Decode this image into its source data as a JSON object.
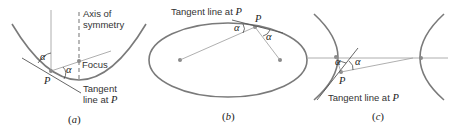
{
  "figure": {
    "panels": [
      {
        "id": "a",
        "shape": "parabola",
        "caption": "(a)",
        "caption_letter": "a",
        "labels": {
          "axis_line1": "Axis of",
          "axis_line2": "symmetry",
          "focus": "Focus",
          "tangent_line1": "Tangent",
          "tangent_line2": "line at",
          "point": "P",
          "angle": "α"
        }
      },
      {
        "id": "b",
        "shape": "ellipse",
        "caption": "(b)",
        "caption_letter": "b",
        "labels": {
          "tangent": "Tangent line at",
          "point": "P",
          "angle": "α"
        }
      },
      {
        "id": "c",
        "shape": "hyperbola",
        "caption": "(c)",
        "caption_letter": "c",
        "labels": {
          "tangent": "Tangent line at",
          "point": "P",
          "angle": "α"
        }
      }
    ]
  }
}
